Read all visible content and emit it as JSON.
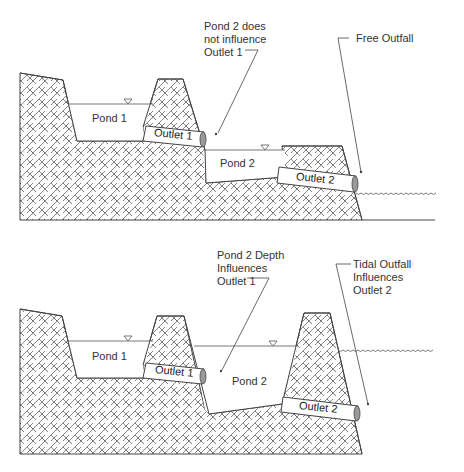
{
  "diagrams": [
    {
      "id": "free-outfall",
      "ponds": [
        {
          "label": "Pond 1"
        },
        {
          "label": "Pond 2"
        }
      ],
      "outlets": [
        {
          "label": "Outlet 1"
        },
        {
          "label": "Outlet 2"
        }
      ],
      "callouts": [
        {
          "lines": [
            "Pond 2 does",
            "not influence",
            "Outlet 1"
          ]
        },
        {
          "lines": [
            "Free Outfall"
          ]
        }
      ]
    },
    {
      "id": "tidal-outfall",
      "ponds": [
        {
          "label": "Pond 1"
        },
        {
          "label": "Pond 2"
        }
      ],
      "outlets": [
        {
          "label": "Outlet 1"
        },
        {
          "label": "Outlet 2"
        }
      ],
      "callouts": [
        {
          "lines": [
            "Pond 2 Depth",
            "Influences",
            "Outlet 1"
          ]
        },
        {
          "lines": [
            "Tidal Outfall",
            "Influences",
            "Outlet 2"
          ]
        }
      ]
    }
  ],
  "colors": {
    "line": "#444444",
    "hatch": "#555555",
    "background": "#ffffff"
  }
}
